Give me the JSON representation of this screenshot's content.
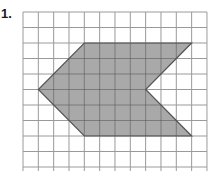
{
  "problem": {
    "number_label": "1."
  },
  "grid": {
    "origin_x": 23,
    "origin_y": 12,
    "cell_w": 15.33,
    "cell_h": 15.5,
    "cols": 12,
    "rows": 11,
    "line_color": "#9a9a9a"
  },
  "shape": {
    "type": "polygon",
    "description": "chevron / arrow-shaped hexagon",
    "vertices_grid_units": [
      [
        4,
        2
      ],
      [
        11,
        2
      ],
      [
        8,
        5
      ],
      [
        11,
        8
      ],
      [
        4,
        8
      ],
      [
        1,
        5
      ]
    ],
    "fill_color": "#a9a9a9",
    "stroke_color": "#555555"
  }
}
